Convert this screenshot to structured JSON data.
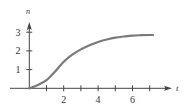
{
  "chart_data": {
    "type": "line",
    "title": "",
    "xlabel": "t",
    "ylabel": "n",
    "xlim": [
      0,
      7.6
    ],
    "ylim": [
      0,
      3.2
    ],
    "x_ticks": [
      1,
      2,
      3,
      4,
      5,
      6,
      7
    ],
    "x_tick_labels": [
      "2",
      "4",
      "6"
    ],
    "x_tick_label_values": [
      2,
      4,
      6
    ],
    "y_ticks": [
      1,
      2,
      3
    ],
    "y_tick_labels": [
      "1",
      "2",
      "3"
    ],
    "grid": false,
    "legend": null,
    "series": [
      {
        "name": "n(t)",
        "color": "#7a7a7a",
        "x": [
          0,
          0.5,
          1,
          1.5,
          2,
          2.5,
          3,
          3.5,
          4,
          4.5,
          5,
          5.5,
          6,
          6.5,
          7,
          7.2
        ],
        "y": [
          0,
          0.18,
          0.44,
          0.9,
          1.42,
          1.8,
          2.08,
          2.3,
          2.48,
          2.61,
          2.71,
          2.77,
          2.82,
          2.84,
          2.85,
          2.85
        ]
      }
    ]
  },
  "axes": {
    "x_label": "t",
    "y_label": "n",
    "axis_color": "#444444",
    "curve_color": "#7a7a7a"
  }
}
